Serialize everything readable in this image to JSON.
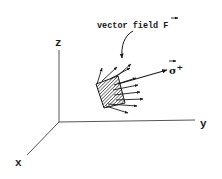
{
  "diagram": {
    "type": "3d-surface-flux",
    "axes": {
      "z_label": "z",
      "y_label": "y",
      "x_label": "x"
    },
    "annotations": {
      "field_label": "vector field F",
      "field_label_text": "vector field ",
      "field_symbol": "F",
      "normal_symbol": "σ",
      "normal_superscript": "+"
    },
    "elements": [
      "coordinate axes x, y, z",
      "hatched surface patch",
      "field arrows emanating from patch",
      "normal vector sigma-plus",
      "curved pointer arrow from label to field"
    ],
    "colors": {
      "ink": "#1a1a1a",
      "axis": "#555555",
      "background": "#ffffff"
    }
  }
}
